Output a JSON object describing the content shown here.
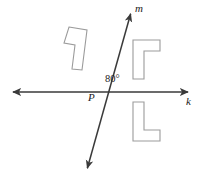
{
  "figure": {
    "background_color": "#ffffff",
    "line_color": "#3a3a3a",
    "shape_stroke_color": "#9b9b9b",
    "shape_fill_color": "#ffffff",
    "text_color": "#1a1a1a"
  },
  "labels": {
    "line_m": "m",
    "line_k": "k",
    "intersection_point": "P",
    "angle_measure": "80°"
  },
  "artifacts": {
    "top_left_mark": "",
    "bottom_left_mark": ""
  },
  "geometry": {
    "point_p": {
      "x": 99,
      "y": 92
    },
    "line_k": {
      "name": "k",
      "start": {
        "x": 9,
        "y": 92
      },
      "end": {
        "x": 192,
        "y": 92
      },
      "arrow_start": true,
      "arrow_end": true
    },
    "line_m": {
      "name": "m",
      "start": {
        "x": 132,
        "y": 9
      },
      "end": {
        "x": 86,
        "y": 173
      },
      "arrow_start": true,
      "arrow_end": true
    },
    "shapes": [
      {
        "name": "shape-top-left",
        "points": "69,27 87,30 82,70 72,69 75,45 64,43",
        "rotated": true
      },
      {
        "name": "shape-upper-right",
        "points": "133,40 160,40 160,51 144,51 144,79 133,79"
      },
      {
        "name": "shape-lower-right",
        "points": "133,102 144,102 144,130 160,130 160,141 133,141"
      }
    ]
  }
}
